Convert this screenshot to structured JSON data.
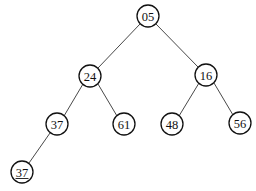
{
  "tree": {
    "nodes": [
      {
        "id": "n0",
        "label": "05",
        "x": 148,
        "y": 16,
        "underlined": false
      },
      {
        "id": "n1",
        "label": "24",
        "x": 90,
        "y": 76,
        "underlined": false
      },
      {
        "id": "n2",
        "label": "16",
        "x": 206,
        "y": 75,
        "underlined": false
      },
      {
        "id": "n3",
        "label": "37",
        "x": 57,
        "y": 124,
        "underlined": false
      },
      {
        "id": "n4",
        "label": "61",
        "x": 124,
        "y": 124,
        "underlined": false
      },
      {
        "id": "n5",
        "label": "48",
        "x": 172,
        "y": 124,
        "underlined": false
      },
      {
        "id": "n6",
        "label": "56",
        "x": 240,
        "y": 123,
        "underlined": false
      },
      {
        "id": "n7",
        "label": "37",
        "x": 22,
        "y": 172,
        "underlined": true
      }
    ],
    "edges": [
      {
        "from": "n0",
        "to": "n1"
      },
      {
        "from": "n0",
        "to": "n2"
      },
      {
        "from": "n1",
        "to": "n3"
      },
      {
        "from": "n1",
        "to": "n4"
      },
      {
        "from": "n2",
        "to": "n5"
      },
      {
        "from": "n2",
        "to": "n6"
      },
      {
        "from": "n3",
        "to": "n7"
      }
    ],
    "radius": 11
  }
}
